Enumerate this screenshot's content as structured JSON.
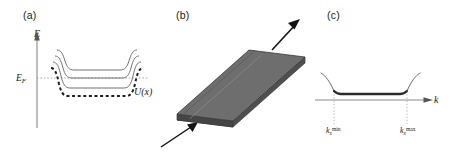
{
  "figure": {
    "width": 453,
    "height": 152,
    "background": "#ffffff",
    "panel_count": 3
  },
  "panels": {
    "a": {
      "label": "(a)",
      "y_axis_label": "E",
      "fermi_level_label": "E",
      "fermi_level_subscript": "F",
      "potential_label": "U(x)",
      "band_curve_count": 3,
      "has_dashed_potential": true,
      "has_dotted_fermi_line": true
    },
    "b": {
      "label": "(b)",
      "shape": "parallelogram-slab",
      "slab_top_color": "#6e6e6e",
      "slab_side_color": "#4f4f4f",
      "slab_edge_color": "#3a3a3a",
      "input_arrow": "incoming-beam-arrow",
      "output_arrow": "outgoing-beam-arrow"
    },
    "c": {
      "label": "(c)",
      "x_axis_label": "k",
      "tick_min": {
        "base": "k",
        "sub": "x",
        "sup": "min"
      },
      "tick_max": {
        "base": "k",
        "sub": "x",
        "sup": "max"
      },
      "curve_description": "flat-bottom well with rising tails",
      "has_dotted_guides": true
    }
  },
  "colors": {
    "line": "#4a4a4a",
    "dark_line": "#2b2b2b",
    "text": "#1a1a1a",
    "axis": "#7a7a7a",
    "dotted": "#9a9a9a"
  }
}
